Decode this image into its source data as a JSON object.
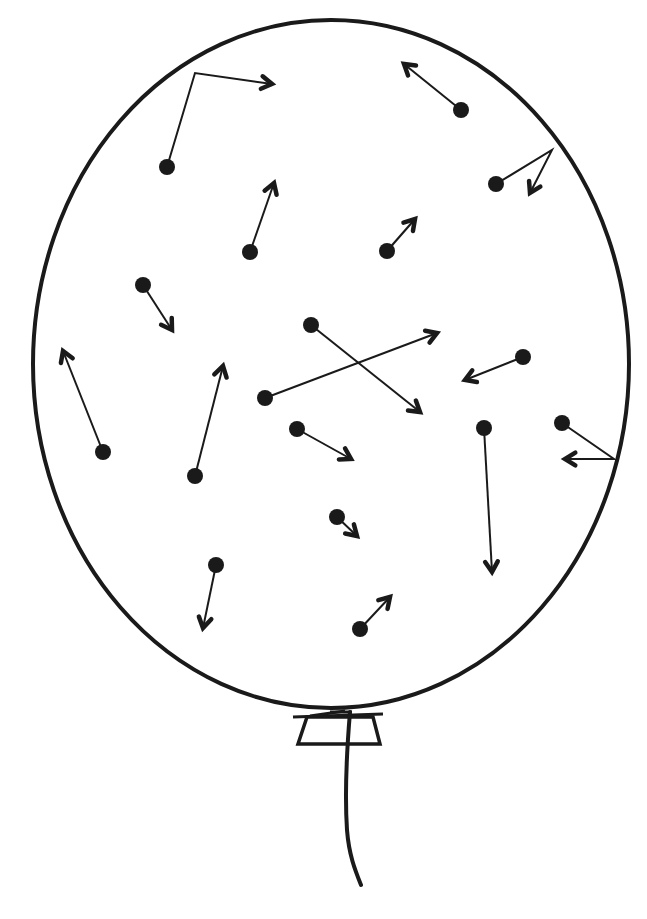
{
  "diagram": {
    "title": "",
    "colors": {
      "ink": "#1a1a1a",
      "background": "#ffffff"
    },
    "balloon": {
      "shape": "ellipse",
      "cx": 331,
      "cy": 364,
      "rx": 298,
      "ry": 344,
      "stroke_width": 4,
      "knot": {
        "top_bar": [
          [
            293,
            717
          ],
          [
            383,
            714
          ]
        ],
        "trapezoid": [
          [
            307,
            717
          ],
          [
            373,
            717
          ],
          [
            380,
            744
          ],
          [
            298,
            744
          ]
        ],
        "tie_lines": [
          [
            [
              310,
              716
            ],
            [
              345,
              711
            ]
          ],
          [
            [
              330,
              712
            ],
            [
              352,
              712
            ]
          ]
        ]
      },
      "string": {
        "path": "M 350 712 C 346 760, 345 800, 347 830 C 349 855, 355 870, 361 885"
      }
    },
    "particles": [
      {
        "id": 1,
        "dot": [
          167,
          167
        ],
        "path": [
          [
            167,
            167
          ],
          [
            195,
            73
          ],
          [
            272,
            84
          ]
        ],
        "note": "bounces off top wall"
      },
      {
        "id": 2,
        "dot": [
          461,
          110
        ],
        "path": [
          [
            461,
            110
          ],
          [
            404,
            64
          ]
        ]
      },
      {
        "id": 3,
        "dot": [
          496,
          184
        ],
        "path": [
          [
            496,
            184
          ],
          [
            552,
            150
          ],
          [
            530,
            193
          ]
        ],
        "note": "bounces off upper-right wall"
      },
      {
        "id": 4,
        "dot": [
          250,
          252
        ],
        "path": [
          [
            250,
            252
          ],
          [
            274,
            183
          ]
        ]
      },
      {
        "id": 5,
        "dot": [
          387,
          251
        ],
        "path": [
          [
            387,
            251
          ],
          [
            415,
            219
          ]
        ]
      },
      {
        "id": 6,
        "dot": [
          143,
          285
        ],
        "path": [
          [
            143,
            285
          ],
          [
            172,
            330
          ]
        ]
      },
      {
        "id": 7,
        "dot": [
          311,
          325
        ],
        "path": [
          [
            311,
            325
          ],
          [
            420,
            412
          ]
        ]
      },
      {
        "id": 8,
        "dot": [
          265,
          398
        ],
        "path": [
          [
            265,
            398
          ],
          [
            437,
            333
          ]
        ]
      },
      {
        "id": 9,
        "dot": [
          523,
          357
        ],
        "path": [
          [
            523,
            357
          ],
          [
            465,
            380
          ]
        ]
      },
      {
        "id": 10,
        "dot": [
          103,
          452
        ],
        "path": [
          [
            103,
            452
          ],
          [
            63,
            351
          ]
        ]
      },
      {
        "id": 11,
        "dot": [
          195,
          476
        ],
        "path": [
          [
            195,
            476
          ],
          [
            223,
            366
          ]
        ]
      },
      {
        "id": 12,
        "dot": [
          297,
          429
        ],
        "path": [
          [
            297,
            429
          ],
          [
            351,
            459
          ]
        ]
      },
      {
        "id": 13,
        "dot": [
          484,
          428
        ],
        "path": [
          [
            484,
            428
          ],
          [
            492,
            572
          ]
        ]
      },
      {
        "id": 14,
        "dot": [
          562,
          423
        ],
        "path": [
          [
            562,
            423
          ],
          [
            614,
            459
          ],
          [
            565,
            459
          ]
        ],
        "note": "bounces off right wall"
      },
      {
        "id": 15,
        "dot": [
          337,
          517
        ],
        "path": [
          [
            337,
            517
          ],
          [
            357,
            536
          ]
        ]
      },
      {
        "id": 16,
        "dot": [
          216,
          565
        ],
        "path": [
          [
            216,
            565
          ],
          [
            203,
            628
          ]
        ]
      },
      {
        "id": 17,
        "dot": [
          360,
          629
        ],
        "path": [
          [
            360,
            629
          ],
          [
            390,
            597
          ]
        ]
      }
    ],
    "dot_radius": 8,
    "arrow": {
      "stroke_width": 2,
      "head_length": 22,
      "head_width": 2.2
    }
  }
}
